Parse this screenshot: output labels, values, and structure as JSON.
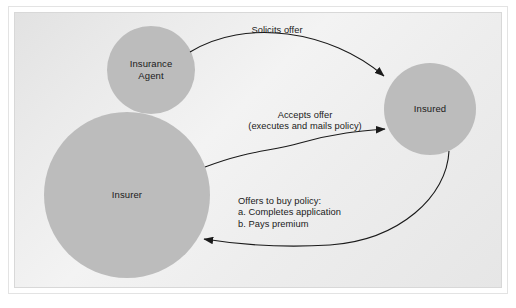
{
  "figure": {
    "kind": "insurance-transaction-flow-diagram",
    "background_color": "#ededed",
    "panel_border_color": "#d8d8d8",
    "node_fill_color": "#bcbcbc",
    "text_color": "#1a1a1a",
    "arrow_color": "#1a1a1a"
  },
  "nodes": [
    {
      "id": "insurance-agent",
      "label": "Insurance\nAgent",
      "cx": 151,
      "cy": 70,
      "r": 44
    },
    {
      "id": "insurer",
      "label": "Insurer",
      "cx": 127,
      "cy": 195,
      "r": 83
    },
    {
      "id": "insured",
      "label": "Insured",
      "cx": 430,
      "cy": 109,
      "r": 46
    }
  ],
  "edges": [
    {
      "id": "solicits-offer",
      "label": "Solicits offer",
      "from": "insurance-agent",
      "to": "insured",
      "label_x": 277,
      "label_y": 25,
      "align": "center"
    },
    {
      "id": "accepts-offer",
      "label": "Accepts offer\n(executes and mails policy)",
      "from": "insurer",
      "to": "insured",
      "label_x": 305,
      "label_y": 110,
      "align": "center"
    },
    {
      "id": "offers-to-buy-policy",
      "label": "Offers to buy policy:\na. Completes application\nb. Pays premium",
      "from": "insured",
      "to": "insurer",
      "label_x": 252,
      "label_y": 196,
      "align": "left"
    }
  ]
}
